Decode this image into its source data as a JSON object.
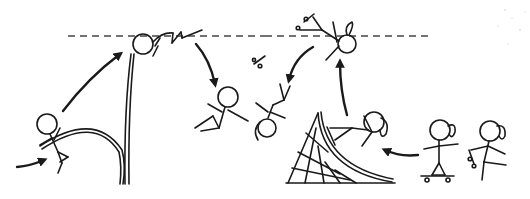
{
  "comic": {
    "description": "Stick-figure comic: pole vaulter vs skateboarder reaching the same height (dashed line)",
    "dashed_line_color": "#444444",
    "ink_color": "#1a1a1a",
    "background": "#ffffff",
    "panels": [
      {
        "name": "pole-vault-sequence",
        "figures": [
          "vaulter-running",
          "vaulter-at-top",
          "vaulter-falling"
        ]
      },
      {
        "name": "skateboard-sequence",
        "figures": [
          "skater-on-board",
          "skater-pushing",
          "skater-on-ramp",
          "skater-at-top",
          "skater-falling"
        ]
      }
    ]
  }
}
